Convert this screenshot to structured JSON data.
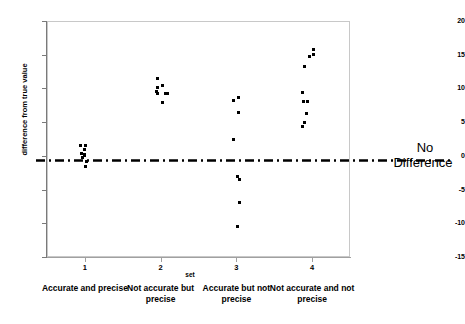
{
  "chart_data": {
    "type": "scatter",
    "title": "",
    "xlabel": "set",
    "ylabel": "difference from true value",
    "ylim": [
      -15,
      20
    ],
    "yticks": [
      20,
      15,
      10,
      5,
      0,
      -5,
      -10,
      -15
    ],
    "ytick_labels": [
      "20",
      "15",
      "10",
      "5",
      "0",
      "-5",
      "-10",
      "-15"
    ],
    "xticks": [
      1,
      2,
      3,
      4
    ],
    "xtick_labels": [
      "1",
      "2",
      "3",
      "4"
    ],
    "categories": [
      "Accurate and precise",
      "Not accurate but precise",
      "Accurate but not precise",
      "Not accurate and not precise"
    ],
    "grid": false,
    "legend": "none",
    "marker": "square",
    "marker_color": "#000000",
    "reference_line": {
      "y": 0,
      "style": "dash-dot",
      "color": "#000000",
      "label": "No Difference",
      "label_line_1": "No",
      "label_line_2": "Difference"
    },
    "series": [
      {
        "name": "set 1 - Accurate and precise",
        "x_category": 1,
        "points": [
          {
            "x": 0.94,
            "y": 1.6
          },
          {
            "x": 1.01,
            "y": 1.6
          },
          {
            "x": 0.99,
            "y": 0.9
          },
          {
            "x": 0.96,
            "y": 0.3
          },
          {
            "x": 0.99,
            "y": 0.2
          },
          {
            "x": 1.0,
            "y": 0.0
          },
          {
            "x": 0.97,
            "y": -0.3
          },
          {
            "x": 1.02,
            "y": -0.9
          },
          {
            "x": 1.01,
            "y": -1.6
          }
        ]
      },
      {
        "name": "set 2 - Not accurate but precise",
        "x_category": 2,
        "points": [
          {
            "x": 1.96,
            "y": 11.5
          },
          {
            "x": 1.96,
            "y": 10.2
          },
          {
            "x": 2.03,
            "y": 10.4
          },
          {
            "x": 1.95,
            "y": 9.6
          },
          {
            "x": 1.96,
            "y": 9.3
          },
          {
            "x": 2.06,
            "y": 9.3
          },
          {
            "x": 2.09,
            "y": 9.2
          },
          {
            "x": 2.02,
            "y": 7.9
          }
        ]
      },
      {
        "name": "set 3 - Accurate but not precise",
        "x_category": 3,
        "points": [
          {
            "x": 2.96,
            "y": 8.2
          },
          {
            "x": 3.03,
            "y": 8.6
          },
          {
            "x": 3.03,
            "y": 6.4
          },
          {
            "x": 2.96,
            "y": 2.5
          },
          {
            "x": 3.01,
            "y": -3.0
          },
          {
            "x": 3.04,
            "y": -3.5
          },
          {
            "x": 3.04,
            "y": -6.9
          },
          {
            "x": 3.02,
            "y": -10.5
          }
        ]
      },
      {
        "name": "set 4 - Not accurate and not precise",
        "x_category": 4,
        "points": [
          {
            "x": 4.02,
            "y": 15.8
          },
          {
            "x": 4.02,
            "y": 15.0
          },
          {
            "x": 3.96,
            "y": 14.8
          },
          {
            "x": 3.9,
            "y": 13.2
          },
          {
            "x": 3.87,
            "y": 9.4
          },
          {
            "x": 3.89,
            "y": 8.0
          },
          {
            "x": 3.94,
            "y": 8.0
          },
          {
            "x": 3.92,
            "y": 6.3
          },
          {
            "x": 3.9,
            "y": 5.0
          },
          {
            "x": 3.87,
            "y": 4.3
          }
        ]
      }
    ]
  }
}
